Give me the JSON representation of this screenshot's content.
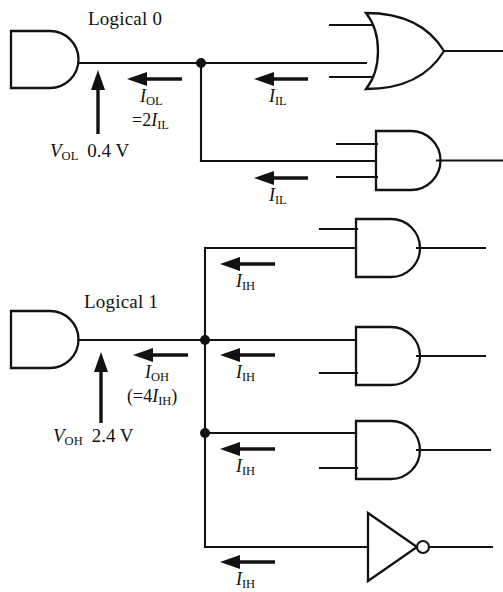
{
  "figure": {
    "type": "logic-gate-fanout-diagram",
    "width": 503,
    "height": 592,
    "background": "#ffffff",
    "ink_color": "#121212"
  },
  "sections": {
    "low": {
      "state_label": "Logical 0",
      "driver_gate": "AND",
      "source_current": "I",
      "source_current_sub": "OL",
      "source_current_relation_op": "=2",
      "source_current_relation_sym": "I",
      "source_current_relation_sub": "IL",
      "voltage_symbol": "V",
      "voltage_sub": "OL",
      "voltage_value": "0.4 V",
      "load_current": "I",
      "load_current_sub": "IL",
      "fanout": 2,
      "loads": [
        {
          "gate": "OR",
          "inputs": 2,
          "current": "I",
          "current_sub": "IL"
        },
        {
          "gate": "AND",
          "inputs": 3,
          "current": "I",
          "current_sub": "IL"
        }
      ]
    },
    "high": {
      "state_label": "Logical 1",
      "driver_gate": "AND",
      "source_current": "I",
      "source_current_sub": "OH",
      "source_current_relation": "(=4",
      "source_current_relation_sym": "I",
      "source_current_relation_sub": "IH",
      "source_current_relation_close": ")",
      "voltage_symbol": "V",
      "voltage_sub": "OH",
      "voltage_value": "2.4 V",
      "load_current": "I",
      "load_current_sub": "IH",
      "fanout": 4,
      "loads": [
        {
          "gate": "AND",
          "inputs": 2,
          "current": "I",
          "current_sub": "IH"
        },
        {
          "gate": "AND",
          "inputs": 2,
          "current": "I",
          "current_sub": "IH"
        },
        {
          "gate": "AND",
          "inputs": 2,
          "current": "I",
          "current_sub": "IH"
        },
        {
          "gate": "NOT",
          "inputs": 1,
          "current": "I",
          "current_sub": "IH"
        }
      ]
    }
  }
}
